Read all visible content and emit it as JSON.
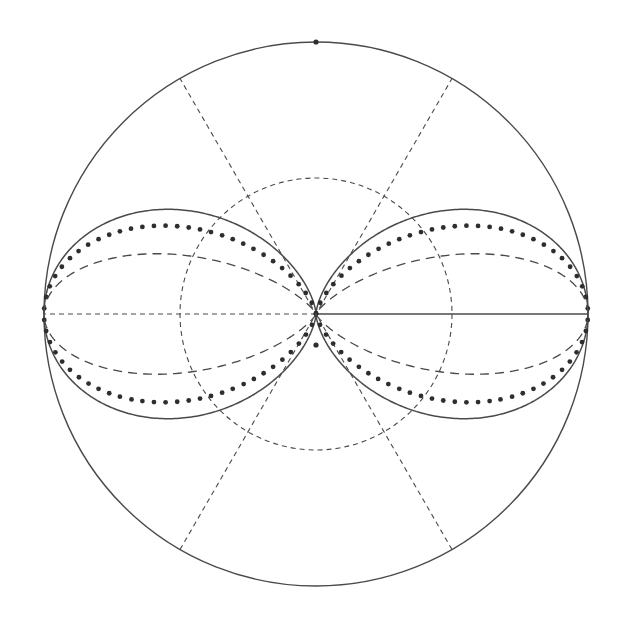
{
  "diagram": {
    "title": "",
    "canvas": {
      "width": 619,
      "height": 619,
      "background": "#ffffff"
    },
    "center": {
      "x": 316,
      "y": 314
    },
    "outer_radius": 272,
    "colors": {
      "line": "#4a4a4a",
      "dots": "#2e2e2e"
    },
    "outer_circle": {
      "radius_fraction": 1.0,
      "style": "solid"
    },
    "inner_circle": {
      "radius_fraction": 0.5,
      "style": "dashed"
    },
    "spokes": [
      {
        "angle_deg": 60,
        "style": "dashed",
        "kind": "diameter"
      },
      {
        "angle_deg": 120,
        "style": "dashed",
        "kind": "diameter"
      },
      {
        "angle_deg": 180,
        "style": "dashed",
        "kind": "radius"
      },
      {
        "angle_deg": 0,
        "style": "solid",
        "kind": "radius"
      }
    ],
    "markers": [
      {
        "name": "top-pole-dot",
        "angle_deg": 90,
        "radius_fraction": 1.0
      },
      {
        "name": "center-offset-dot",
        "x_offset": 0,
        "y_offset": 31
      }
    ],
    "lobes": [
      {
        "name": "solid-lobe",
        "style": "solid",
        "formula": "r = R cos^2(theta)",
        "exponent": 2
      },
      {
        "name": "dotted-lobe",
        "style": "dotted",
        "formula": "r = R cos^3(theta)",
        "exponent": 3,
        "dot_spacing_px": 11.5,
        "dot_radius": 2.4
      },
      {
        "name": "dashed-lobe",
        "style": "long-dashed",
        "formula": "r = R cos^7(theta)",
        "exponent": 7
      }
    ]
  }
}
